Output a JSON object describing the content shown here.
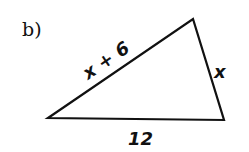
{
  "part_label": "b)",
  "triangle": {
    "vertices": [
      [
        48,
        118
      ],
      [
        193,
        19
      ],
      [
        224,
        120
      ]
    ],
    "sides": {
      "hypotenuse_label": "x + 6",
      "right_label": "x",
      "base_label": "12"
    }
  }
}
